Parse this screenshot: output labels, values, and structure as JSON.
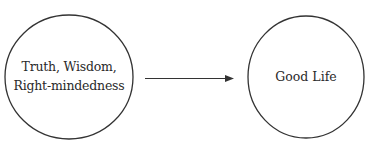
{
  "diagram": {
    "type": "flow",
    "nodes": [
      {
        "id": "source",
        "shape": "circle",
        "lines": [
          "Truth, Wisdom,",
          "Right-mindedness"
        ]
      },
      {
        "id": "target",
        "shape": "circle",
        "lines": [
          "Good Life"
        ]
      }
    ],
    "edges": [
      {
        "from": "source",
        "to": "target",
        "style": "arrow"
      }
    ],
    "colors": {
      "stroke": "#333333",
      "text": "#2a2a2a",
      "background": "#ffffff"
    }
  }
}
